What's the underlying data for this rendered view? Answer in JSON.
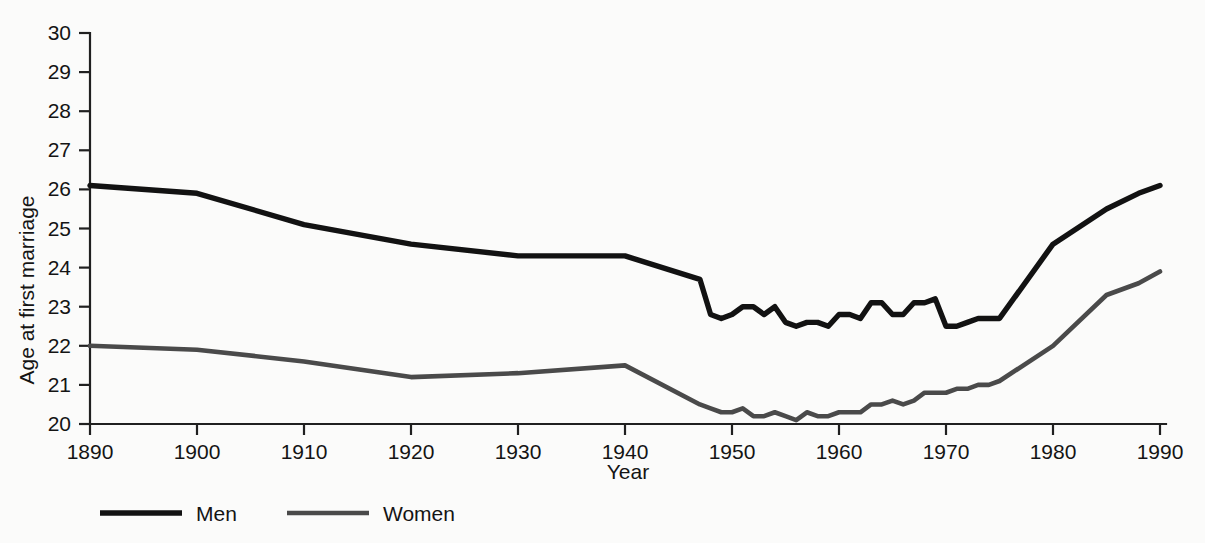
{
  "chart_data": {
    "type": "line",
    "title": "",
    "xlabel": "Year",
    "ylabel": "Age at first marriage",
    "xlim": [
      1890,
      1990
    ],
    "ylim": [
      20,
      30
    ],
    "grid": false,
    "legend_position": "bottom-left",
    "xticks": [
      1890,
      1900,
      1910,
      1920,
      1930,
      1940,
      1950,
      1960,
      1970,
      1980,
      1990
    ],
    "yticks": [
      20,
      21,
      22,
      23,
      24,
      25,
      26,
      27,
      28,
      29,
      30
    ],
    "xtick_labels": [
      "1890",
      "1900",
      "1910",
      "1920",
      "1930",
      "1940",
      "1950",
      "1960",
      "1970",
      "1980",
      "1990"
    ],
    "ytick_labels": [
      "20",
      "21",
      "22",
      "23",
      "24",
      "25",
      "26",
      "27",
      "28",
      "29",
      "30"
    ],
    "colors": {
      "men": "#121212",
      "women": "#4a4a4a",
      "axis": "#202020",
      "background": "#fbfbfa"
    },
    "series": [
      {
        "name": "Men",
        "color": "#121212",
        "x": [
          1890,
          1900,
          1910,
          1920,
          1930,
          1940,
          1947,
          1948,
          1949,
          1950,
          1951,
          1952,
          1953,
          1954,
          1955,
          1956,
          1957,
          1958,
          1959,
          1960,
          1961,
          1962,
          1963,
          1964,
          1965,
          1966,
          1967,
          1968,
          1969,
          1970,
          1971,
          1972,
          1973,
          1974,
          1975,
          1980,
          1985,
          1988,
          1990
        ],
        "values": [
          26.1,
          25.9,
          25.1,
          24.6,
          24.3,
          24.3,
          23.7,
          22.8,
          22.7,
          22.8,
          23.0,
          23.0,
          22.8,
          23.0,
          22.6,
          22.5,
          22.6,
          22.6,
          22.5,
          22.8,
          22.8,
          22.7,
          23.1,
          23.1,
          22.8,
          22.8,
          23.1,
          23.1,
          23.2,
          22.5,
          22.5,
          22.6,
          22.7,
          22.7,
          22.7,
          24.6,
          25.5,
          25.9,
          26.1
        ],
        "endpoint_labels": {
          "start": 26.1,
          "end": 26.0
        }
      },
      {
        "name": "Women",
        "color": "#4a4a4a",
        "x": [
          1890,
          1900,
          1910,
          1920,
          1930,
          1940,
          1947,
          1948,
          1949,
          1950,
          1951,
          1952,
          1953,
          1954,
          1955,
          1956,
          1957,
          1958,
          1959,
          1960,
          1961,
          1962,
          1963,
          1964,
          1965,
          1966,
          1967,
          1968,
          1969,
          1970,
          1971,
          1972,
          1973,
          1974,
          1975,
          1980,
          1985,
          1988,
          1990
        ],
        "values": [
          22.0,
          21.9,
          21.6,
          21.2,
          21.3,
          21.5,
          20.5,
          20.4,
          20.3,
          20.3,
          20.4,
          20.2,
          20.2,
          20.3,
          20.2,
          20.1,
          20.3,
          20.2,
          20.2,
          20.3,
          20.3,
          20.3,
          20.5,
          20.5,
          20.6,
          20.5,
          20.6,
          20.8,
          20.8,
          20.8,
          20.9,
          20.9,
          21.0,
          21.0,
          21.1,
          22.0,
          23.3,
          23.6,
          23.9
        ],
        "endpoint_labels": {
          "start": 22.0,
          "end": 24.2
        }
      }
    ],
    "legend": [
      {
        "label": "Men",
        "color": "#121212"
      },
      {
        "label": "Women",
        "color": "#4a4a4a"
      }
    ]
  },
  "axis": {
    "y_title": "Age at first marriage",
    "x_title": "Year"
  }
}
